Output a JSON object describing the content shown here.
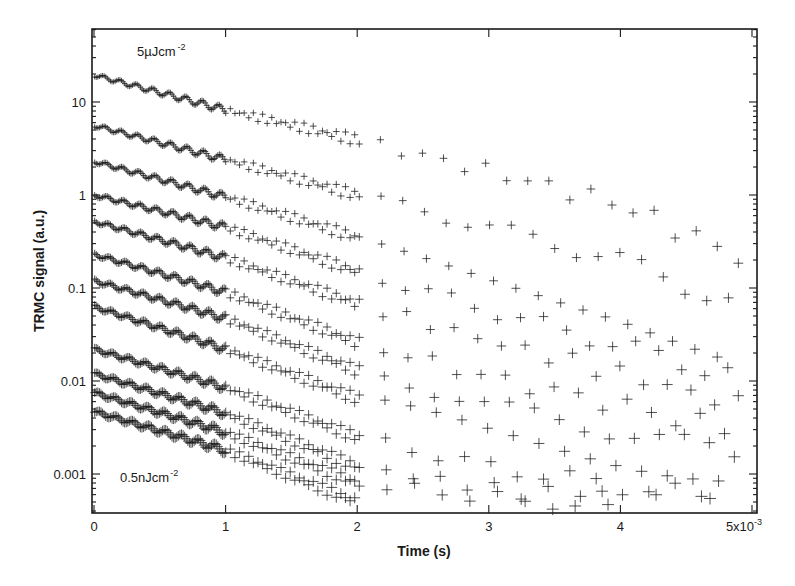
{
  "chart_data": {
    "type": "scatter",
    "title": "",
    "xlabel": "Time (s)",
    "ylabel": "TRMC signal (a.u.)",
    "x_scale": "linear",
    "y_scale": "log",
    "x_multiplier_label": "x10-3",
    "xlim": [
      0,
      0.005
    ],
    "ylim": [
      0.0004,
      60
    ],
    "x_ticks": [
      0,
      1,
      2,
      3,
      4,
      5
    ],
    "x_tick_labels": [
      "0",
      "1",
      "2",
      "3",
      "4",
      "5x10"
    ],
    "x_tick_exponent": "-3",
    "y_ticks": [
      0.001,
      0.01,
      0.1,
      1,
      10
    ],
    "y_tick_labels": [
      "0.001",
      "0.01",
      "0.1",
      "1",
      "10"
    ],
    "grid": false,
    "legend": null,
    "marker": "+",
    "annotations": [
      {
        "text": "5µJcm",
        "sup": "-2",
        "position": "top-left",
        "refers_to": "top series"
      },
      {
        "text": "0.5nJcm",
        "sup": "-2",
        "position": "bottom-left",
        "refers_to": "bottom series"
      }
    ],
    "x_ms": [
      0,
      1,
      2,
      3,
      4,
      4.9
    ],
    "series": [
      {
        "name": "5µJcm-2",
        "values": [
          19.5,
          8.2,
          3.9,
          1.8,
          0.8,
          0.22
        ]
      },
      {
        "name": "series-2",
        "values": [
          5.6,
          2.4,
          1.0,
          0.45,
          0.2,
          0.065
        ]
      },
      {
        "name": "series-3",
        "values": [
          2.3,
          0.95,
          0.35,
          0.14,
          0.055,
          0.018
        ]
      },
      {
        "name": "series-4",
        "values": [
          1.0,
          0.45,
          0.15,
          0.058,
          0.024,
          0.011
        ]
      },
      {
        "name": "series-5",
        "values": [
          0.52,
          0.21,
          0.068,
          0.027,
          0.012,
          0.0055
        ]
      },
      {
        "name": "series-6",
        "values": [
          0.23,
          0.09,
          0.026,
          0.011,
          0.0055,
          0.0028
        ]
      },
      {
        "name": "series-7",
        "values": [
          0.12,
          0.047,
          0.013,
          0.0055,
          0.0028,
          0.0016
        ]
      },
      {
        "name": "series-8",
        "values": [
          0.063,
          0.022,
          0.0065,
          0.0028,
          0.0015,
          0.00085
        ]
      },
      {
        "name": "series-9",
        "values": [
          0.022,
          0.0085,
          0.0025,
          0.0012,
          0.00075,
          0.0005
        ]
      },
      {
        "name": "series-10",
        "values": [
          0.012,
          0.0045,
          0.0012,
          0.0007,
          0.0005,
          0.00045
        ]
      },
      {
        "name": "series-11",
        "values": [
          0.0075,
          0.0028,
          0.0008,
          0.00055,
          0.00045,
          null
        ]
      },
      {
        "name": "0.5nJcm-2",
        "values": [
          0.0047,
          0.0018,
          0.0005,
          null,
          null,
          null
        ]
      }
    ]
  },
  "labels": {
    "x_axis_title": "Time (s)",
    "y_axis_title": "TRMC signal (a.u.)",
    "top_annotation": "5µJcm",
    "top_annotation_sup": "-2",
    "bottom_annotation": "0.5nJcm",
    "bottom_annotation_sup": "-2",
    "x_exponent": "-3"
  },
  "colors": {
    "ink": "#1a1a1a",
    "background": "#ffffff"
  }
}
